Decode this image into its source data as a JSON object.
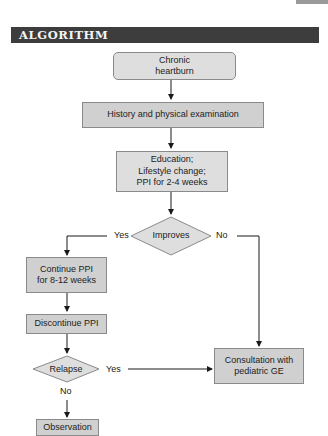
{
  "header": {
    "title": "ALGORITHM"
  },
  "nodes": {
    "start": "Chronic heartburn",
    "history": "History and physical examination",
    "education_l1": "Education;",
    "education_l2": "Lifestyle change;",
    "education_l3": "PPI for 2-4 weeks",
    "improves": "Improves",
    "continue_l1": "Continue PPI",
    "continue_l2": "for 8-12 weeks",
    "discontinue": "Discontinue PPI",
    "relapse": "Relapse",
    "consult_l1": "Consultation with",
    "consult_l2": "pediatric GE",
    "observation": "Observation",
    "start_l1": "Chronic",
    "start_l2": "heartburn"
  },
  "edges": {
    "improves_yes": "Yes",
    "improves_no": "No",
    "relapse_yes": "Yes",
    "relapse_no": "No"
  },
  "colors": {
    "header_bg": "#3d3d3d",
    "box_fill": "#d0d0d0",
    "box_fill_light": "#dedede",
    "line": "#1a1a1a"
  }
}
